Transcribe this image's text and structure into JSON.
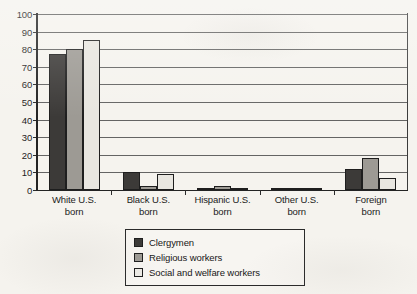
{
  "chart_data": {
    "type": "bar",
    "title": "",
    "xlabel": "",
    "ylabel": "",
    "ylim": [
      0,
      100
    ],
    "ytick_step": 10,
    "yticks": [
      100,
      90,
      80,
      70,
      60,
      50,
      40,
      30,
      20,
      10,
      0
    ],
    "grid": true,
    "legend_position": "bottom-center",
    "categories": [
      "White U.S. born",
      "Black U.S. born",
      "Hispanic U.S. born",
      "Other U.S. born",
      "Foreign born"
    ],
    "category_lines": [
      [
        "White U.S.",
        "born"
      ],
      [
        "Black U.S.",
        "born"
      ],
      [
        "Hispanic U.S.",
        "born"
      ],
      [
        "Other U.S.",
        "born"
      ],
      [
        "Foreign",
        "born"
      ]
    ],
    "series": [
      {
        "name": "Clergymen",
        "color": "#3c3a38",
        "values": [
          77,
          10,
          1,
          0.5,
          12
        ]
      },
      {
        "name": "Religious workers",
        "color": "#9d9a94",
        "values": [
          80,
          2,
          2,
          1,
          18
        ]
      },
      {
        "name": "Social and welfare workers",
        "color": "#e8e6e0",
        "values": [
          85,
          9,
          1,
          0.5,
          7
        ]
      }
    ]
  },
  "legend": {
    "items": [
      {
        "label": "Clergymen"
      },
      {
        "label": "Religious workers"
      },
      {
        "label": "Social and welfare workers"
      }
    ]
  }
}
